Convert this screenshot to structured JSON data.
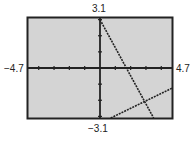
{
  "labels": {
    "ymax": "3.1",
    "ymin": "−3.1",
    "xmin": "−4.7",
    "xmax": "4.7"
  },
  "colors": {
    "screen": "#d4d4d4",
    "frame": "#222222",
    "line": "#222222"
  },
  "chart_data": {
    "type": "line",
    "title": "",
    "xlabel": "",
    "ylabel": "",
    "xlim": [
      -4.7,
      4.7
    ],
    "ylim": [
      -3.1,
      3.1
    ],
    "xticks": [
      -4,
      -3,
      -2,
      -1,
      1,
      2,
      3,
      4
    ],
    "yticks": [
      -3,
      -2,
      -1,
      1,
      2,
      3
    ],
    "series": [
      {
        "name": "line 1",
        "x": [
          0,
          3.5
        ],
        "y": [
          3,
          -3.1
        ]
      },
      {
        "name": "line 2",
        "x": [
          0.7,
          4.7
        ],
        "y": [
          -3.1,
          -1.25
        ]
      }
    ]
  }
}
